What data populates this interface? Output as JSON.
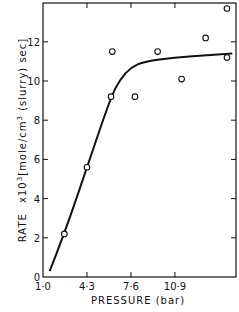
{
  "chart_data": {
    "type": "scatter",
    "title": "",
    "xlabel": "PRESSURE (bar)",
    "ylabel": "RATE x10^3 [mole/cm^3 (slurry) sec]",
    "ylabel_parts": {
      "rate": "RATE",
      "mult": "x10",
      "exp": "3",
      "units": "[mole/cm",
      "units_exp": "3",
      "units_tail": " (slurry) sec]"
    },
    "xlim": [
      1.0,
      15.5
    ],
    "ylim": [
      0,
      14
    ],
    "x_ticks": [
      1.0,
      4.3,
      7.6,
      10.9
    ],
    "x_tick_labels": [
      "1·0",
      "4·3",
      "7·6",
      "10·9"
    ],
    "y_ticks": [
      0,
      2,
      4,
      6,
      8,
      10,
      12
    ],
    "y_tick_labels": [
      "0",
      "2",
      "4",
      "6",
      "8",
      "10",
      "12"
    ],
    "grid": false,
    "series": [
      {
        "name": "Experimental",
        "marker": "open-circle",
        "points": [
          {
            "x": 2.6,
            "y": 2.2
          },
          {
            "x": 4.3,
            "y": 5.6
          },
          {
            "x": 6.1,
            "y": 9.2
          },
          {
            "x": 6.2,
            "y": 11.5
          },
          {
            "x": 7.9,
            "y": 9.2
          },
          {
            "x": 9.6,
            "y": 11.5
          },
          {
            "x": 11.4,
            "y": 10.1
          },
          {
            "x": 13.2,
            "y": 12.2
          },
          {
            "x": 14.8,
            "y": 13.7
          },
          {
            "x": 14.8,
            "y": 11.2
          }
        ]
      },
      {
        "name": "Fitted curve",
        "marker": "line",
        "points": [
          {
            "x": 1.5,
            "y": 0.3
          },
          {
            "x": 2.6,
            "y": 2.2
          },
          {
            "x": 4.3,
            "y": 5.6
          },
          {
            "x": 6.1,
            "y": 9.2
          },
          {
            "x": 6.8,
            "y": 10.1
          },
          {
            "x": 7.6,
            "y": 10.7
          },
          {
            "x": 8.6,
            "y": 11.0
          },
          {
            "x": 10.9,
            "y": 11.2
          },
          {
            "x": 13.0,
            "y": 11.3
          },
          {
            "x": 15.2,
            "y": 11.4
          }
        ]
      }
    ]
  }
}
